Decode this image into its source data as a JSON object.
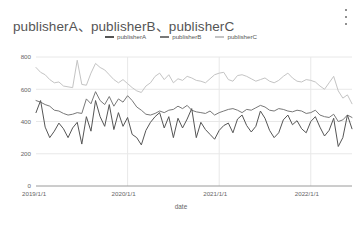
{
  "card": {
    "title": "publisherA、publisherB、publisherC",
    "menu_icon": "kebab-menu-icon"
  },
  "legend": {
    "position": "top-center",
    "items": [
      {
        "label": "publisherA",
        "color": "#555555"
      },
      {
        "label": "publisherB",
        "color": "#787878"
      },
      {
        "label": "publisherC",
        "color": "#c4c4c4"
      }
    ]
  },
  "chart_data": {
    "type": "line",
    "title": "publisherA、publisherB、publisherC",
    "xlabel": "date",
    "ylabel": "",
    "grid": true,
    "ylim": [
      0,
      800
    ],
    "yticks": [
      0,
      200,
      400,
      600,
      800
    ],
    "xticks": [
      "2019/1/1",
      "2020/1/1",
      "2021/1/1",
      "2022/1/1"
    ],
    "xlim": [
      "2019/1/1",
      "2022/7/1"
    ],
    "x_index": [
      0,
      1,
      2,
      3,
      4,
      5,
      6,
      7,
      8,
      9,
      10,
      11,
      12,
      13,
      14,
      15,
      16,
      17,
      18,
      19,
      20,
      21,
      22,
      23,
      24,
      25,
      26,
      27,
      28,
      29,
      30,
      31,
      32,
      33,
      34,
      35,
      36,
      37,
      38,
      39,
      40,
      41,
      42,
      43,
      44,
      45,
      46,
      47,
      48,
      49,
      50,
      51,
      52,
      53,
      54,
      55,
      56,
      57,
      58,
      59,
      60,
      61,
      62,
      63,
      64,
      65,
      66,
      67,
      68,
      69
    ],
    "series": [
      {
        "name": "publisherA",
        "color": "#555555",
        "values": [
          455,
          530,
          365,
          300,
          340,
          390,
          355,
          300,
          360,
          395,
          260,
          430,
          340,
          530,
          430,
          370,
          505,
          350,
          455,
          370,
          425,
          320,
          300,
          255,
          345,
          395,
          430,
          455,
          360,
          430,
          300,
          420,
          360,
          415,
          480,
          300,
          395,
          350,
          320,
          290,
          345,
          375,
          390,
          330,
          415,
          440,
          375,
          335,
          370,
          465,
          420,
          345,
          300,
          330,
          410,
          440,
          380,
          405,
          355,
          330,
          400,
          430,
          365,
          310,
          345,
          420,
          245,
          300,
          440,
          355
        ]
      },
      {
        "name": "publisherB",
        "color": "#787878",
        "values": [
          530,
          520,
          505,
          495,
          470,
          465,
          450,
          440,
          445,
          455,
          450,
          540,
          510,
          585,
          530,
          505,
          555,
          495,
          540,
          520,
          560,
          530,
          490,
          470,
          445,
          440,
          450,
          465,
          455,
          470,
          475,
          495,
          480,
          500,
          470,
          460,
          455,
          450,
          465,
          440,
          455,
          465,
          475,
          480,
          470,
          455,
          475,
          470,
          485,
          500,
          490,
          470,
          465,
          480,
          475,
          465,
          460,
          470,
          465,
          450,
          455,
          470,
          440,
          430,
          425,
          445,
          400,
          410,
          440,
          425
        ]
      },
      {
        "name": "publisherC",
        "color": "#c4c4c4",
        "values": [
          735,
          705,
          690,
          660,
          640,
          645,
          620,
          615,
          610,
          780,
          630,
          625,
          700,
          760,
          735,
          720,
          690,
          660,
          640,
          660,
          635,
          610,
          590,
          580,
          620,
          640,
          680,
          700,
          660,
          690,
          640,
          665,
          655,
          680,
          670,
          655,
          650,
          640,
          665,
          690,
          700,
          705,
          660,
          650,
          685,
          690,
          680,
          665,
          650,
          660,
          670,
          650,
          640,
          655,
          680,
          700,
          670,
          650,
          645,
          660,
          655,
          645,
          620,
          600,
          640,
          680,
          590,
          545,
          565,
          510
        ]
      }
    ]
  }
}
